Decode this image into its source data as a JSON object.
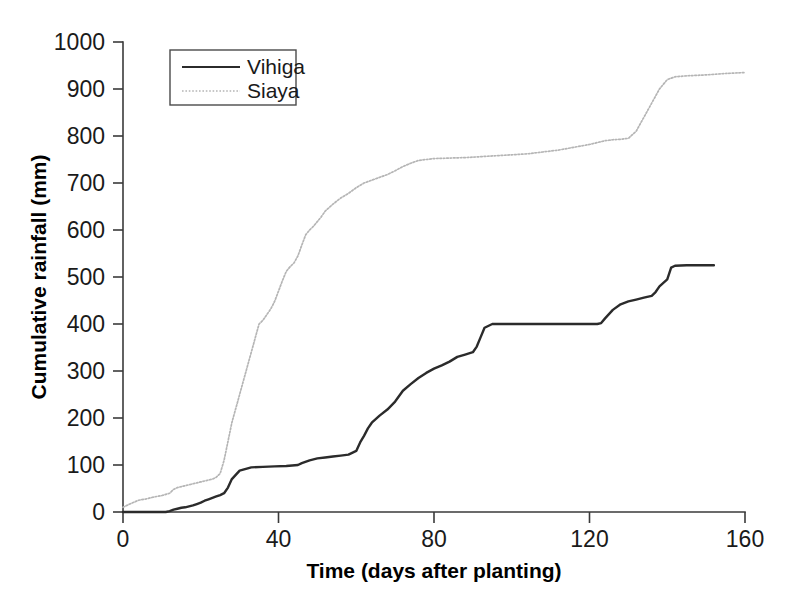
{
  "chart_data": {
    "type": "line",
    "title": "",
    "xlabel": "Time (days after planting)",
    "ylabel": "Cumulative rainfall (mm)",
    "xlim": [
      0,
      160
    ],
    "ylim": [
      0,
      1000
    ],
    "xticks": [
      0,
      40,
      80,
      120,
      160
    ],
    "yticks": [
      0,
      100,
      200,
      300,
      400,
      500,
      600,
      700,
      800,
      900,
      1000
    ],
    "grid": false,
    "legend_position": "top-left",
    "series": [
      {
        "name": "Vihiga",
        "style": "solid",
        "color": "#2b2b2b",
        "x": [
          0,
          4,
          8,
          11,
          12,
          13,
          14,
          15,
          16,
          17,
          18,
          19,
          20,
          21,
          22,
          23,
          24,
          25,
          26,
          27,
          28,
          30,
          33,
          36,
          39,
          42,
          45,
          46,
          48,
          50,
          52,
          54,
          56,
          58,
          60,
          61,
          62,
          63,
          64,
          66,
          68,
          70,
          72,
          74,
          76,
          78,
          80,
          82,
          84,
          86,
          88,
          90,
          91,
          92,
          93,
          95,
          100,
          105,
          110,
          115,
          120,
          122,
          123,
          124,
          126,
          128,
          130,
          132,
          134,
          136,
          137,
          138,
          140,
          141,
          142,
          145,
          148,
          152
        ],
        "y": [
          0,
          0,
          0,
          0,
          2,
          5,
          7,
          9,
          10,
          12,
          14,
          17,
          20,
          24,
          27,
          30,
          33,
          36,
          40,
          52,
          70,
          88,
          95,
          96,
          97,
          98,
          100,
          104,
          110,
          114,
          116,
          118,
          120,
          122,
          130,
          148,
          162,
          178,
          190,
          205,
          218,
          235,
          258,
          272,
          285,
          296,
          305,
          312,
          320,
          330,
          335,
          340,
          352,
          372,
          392,
          400,
          400,
          400,
          400,
          400,
          400,
          400,
          402,
          412,
          430,
          442,
          448,
          452,
          456,
          460,
          468,
          480,
          495,
          520,
          524,
          525,
          525,
          525
        ]
      },
      {
        "name": "Siaya",
        "style": "dotted",
        "color": "#b5b5b5",
        "x": [
          0,
          2,
          4,
          6,
          8,
          10,
          12,
          13,
          14,
          15,
          16,
          17,
          18,
          19,
          20,
          21,
          22,
          23,
          24,
          25,
          26,
          27,
          28,
          29,
          30,
          31,
          32,
          33,
          34,
          35,
          36,
          37,
          38,
          39,
          40,
          41,
          42,
          43,
          44,
          45,
          46,
          47,
          48,
          49,
          50,
          51,
          52,
          54,
          56,
          58,
          60,
          62,
          64,
          66,
          68,
          70,
          72,
          74,
          76,
          78,
          80,
          84,
          88,
          92,
          96,
          100,
          104,
          108,
          112,
          116,
          120,
          122,
          124,
          126,
          128,
          130,
          132,
          134,
          136,
          138,
          140,
          142,
          145,
          150,
          155,
          160
        ],
        "y": [
          10,
          18,
          25,
          28,
          32,
          35,
          40,
          48,
          52,
          54,
          56,
          58,
          60,
          62,
          64,
          66,
          68,
          70,
          74,
          82,
          110,
          150,
          190,
          220,
          250,
          280,
          310,
          340,
          370,
          400,
          408,
          420,
          432,
          448,
          470,
          492,
          512,
          522,
          530,
          545,
          568,
          590,
          600,
          608,
          618,
          628,
          640,
          655,
          668,
          678,
          690,
          700,
          706,
          712,
          718,
          726,
          735,
          742,
          748,
          750,
          752,
          753,
          754,
          756,
          758,
          760,
          762,
          766,
          770,
          776,
          782,
          786,
          790,
          792,
          793,
          795,
          810,
          840,
          870,
          900,
          920,
          926,
          928,
          930,
          933,
          935
        ]
      }
    ]
  },
  "legend": {
    "items": [
      {
        "label": "Vihiga",
        "style": "solid"
      },
      {
        "label": "Siaya",
        "style": "dotted"
      }
    ]
  }
}
